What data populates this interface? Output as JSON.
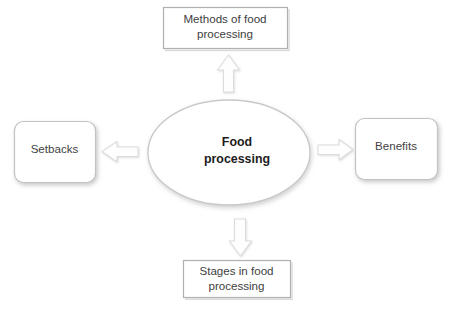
{
  "diagram": {
    "type": "hub-and-spoke",
    "center": {
      "name": "food-processing",
      "label": "Food\nprocessing",
      "shape": "ellipse"
    },
    "nodes": [
      {
        "id": "methods",
        "label": "Methods of food\nprocessing",
        "shape": "rectangle",
        "position": "top",
        "arrow": "arrow-up"
      },
      {
        "id": "setbacks",
        "label": "Setbacks",
        "shape": "rounded-rectangle",
        "position": "left",
        "arrow": "arrow-left"
      },
      {
        "id": "benefits",
        "label": "Benefits",
        "shape": "rounded-rectangle",
        "position": "right",
        "arrow": "arrow-right"
      },
      {
        "id": "stages",
        "label": "Stages in food\nprocessing",
        "shape": "rectangle",
        "position": "bottom",
        "arrow": "arrow-down"
      }
    ],
    "colors": {
      "background": "#ffffff",
      "shape_fill": "#ffffff",
      "shape_stroke": "#b9b9b9",
      "arrow_fill": "#fdfdfd",
      "arrow_stroke": "#d8d8d8",
      "text": "#3a3a3a",
      "center_text": "#1c1c1c"
    }
  }
}
